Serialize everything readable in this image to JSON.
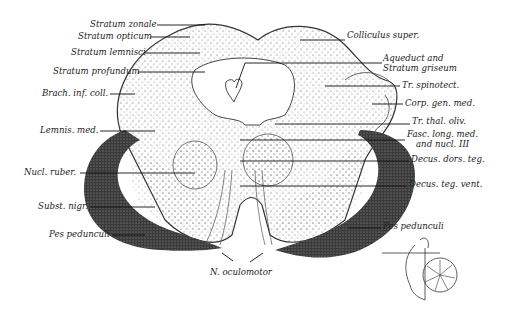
{
  "figure": {
    "signature": "E.W.Eger"
  },
  "labels_left": [
    {
      "text": "Stratum zonale",
      "x": 90,
      "y": 22
    },
    {
      "text": "Stratum opticum",
      "x": 78,
      "y": 33
    },
    {
      "text": "Stratum lemnisci",
      "x": 71,
      "y": 48
    },
    {
      "text": "Stratum profundum",
      "x": 53,
      "y": 68
    },
    {
      "text": "Brach. inf. coll.",
      "x": 42,
      "y": 90
    },
    {
      "text": "Lemnis. med.",
      "x": 40,
      "y": 127
    },
    {
      "text": "Nucl. ruber.",
      "x": 24,
      "y": 168
    },
    {
      "text": "Subst. nigr.",
      "x": 38,
      "y": 203
    },
    {
      "text": "Pes pedunculi",
      "x": 49,
      "y": 231
    }
  ],
  "labels_right": [
    {
      "text": "Colliculus super.",
      "x": 347,
      "y": 32
    },
    {
      "text": "Aqueduct and",
      "x": 383,
      "y": 55
    },
    {
      "text": "Stratum griseum",
      "x": 383,
      "y": 65
    },
    {
      "text": "Tr. spinotect.",
      "x": 402,
      "y": 80
    },
    {
      "text": "Corp. gen. med.",
      "x": 405,
      "y": 97
    },
    {
      "text": "Tr. thal. oliv.",
      "x": 412,
      "y": 116
    },
    {
      "text": "Fasc. long. med.",
      "x": 407,
      "y": 130
    },
    {
      "text": "and nucl. III",
      "x": 416,
      "y": 140
    },
    {
      "text": "Decus. dors. teg.",
      "x": 411,
      "y": 154
    },
    {
      "text": "Decus. teg. vent.",
      "x": 409,
      "y": 178
    },
    {
      "text": "Pes pedunculi",
      "x": 383,
      "y": 220
    }
  ],
  "labels_bottom": [
    {
      "text": "N. oculomotor",
      "x": 210,
      "y": 268
    }
  ]
}
